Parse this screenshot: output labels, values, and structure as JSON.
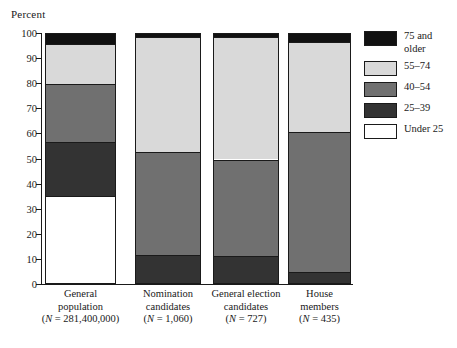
{
  "chart_data": {
    "type": "bar",
    "subtype": "stacked-bar-100",
    "title": "",
    "xlabel": "",
    "ylabel": "Percent",
    "ylim": [
      0,
      100
    ],
    "ytick_labels": [
      "100",
      "90",
      "80",
      "70",
      "60",
      "50",
      "40",
      "30",
      "20",
      "10",
      "0"
    ],
    "yticks": [
      100,
      90,
      80,
      70,
      60,
      50,
      40,
      30,
      20,
      10,
      0
    ],
    "grid": false,
    "legend_position": "right",
    "categories": [
      "General population (N = 281,400,000)",
      "Nomination candidates (N = 1,060)",
      "General election candidates (N = 727)",
      "House members (N = 435)"
    ],
    "category_lines": [
      [
        "General",
        "population",
        "(N = 281,400,000)"
      ],
      [
        "Nomination",
        "candidates",
        "(N = 1,060)"
      ],
      [
        "General election",
        "candidates",
        "(N = 727)"
      ],
      [
        "House",
        "members",
        "(N = 435)"
      ]
    ],
    "series": [
      {
        "name": "Under 25",
        "color": "#ffffff",
        "values": [
          35.5,
          0,
          0,
          0
        ]
      },
      {
        "name": "25–39",
        "color": "#333333",
        "values": [
          21.5,
          12,
          11.5,
          5
        ]
      },
      {
        "name": "40–54",
        "color": "#707070",
        "values": [
          23,
          41,
          38.5,
          56
        ]
      },
      {
        "name": "55–74",
        "color": "#d9d9d9",
        "values": [
          16,
          46,
          49,
          36
        ]
      },
      {
        "name": "75 and older",
        "color": "#111111",
        "values": [
          4,
          1,
          1,
          3
        ]
      }
    ]
  },
  "legend": {
    "entries": [
      {
        "label_lines": [
          "75 and",
          "older"
        ],
        "color": "#111111"
      },
      {
        "label_lines": [
          "55–74"
        ],
        "color": "#d9d9d9"
      },
      {
        "label_lines": [
          "40–54"
        ],
        "color": "#707070"
      },
      {
        "label_lines": [
          "25–39"
        ],
        "color": "#333333"
      },
      {
        "label_lines": [
          "Under 25"
        ],
        "color": "#ffffff"
      }
    ]
  }
}
